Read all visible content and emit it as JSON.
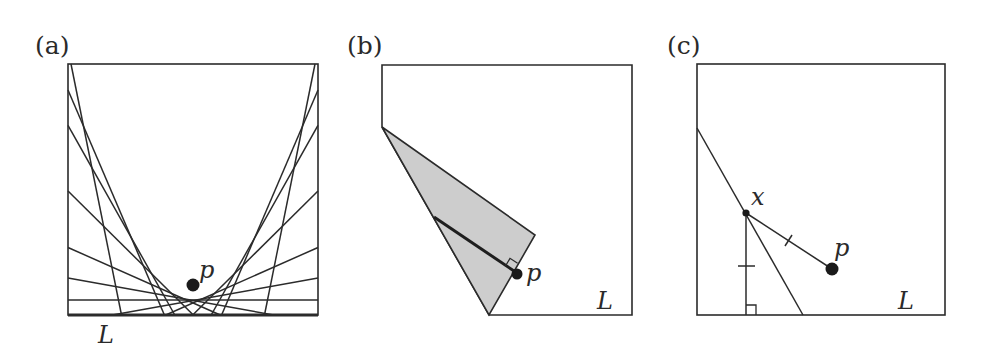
{
  "figure": {
    "panels": [
      {
        "id": "a",
        "label": "(a)",
        "point_label": "p",
        "line_label": "L",
        "description": "Family of fold creases tangent to a parabola with focus p and directrix L"
      },
      {
        "id": "b",
        "label": "(b)",
        "point_label": "p",
        "line_label": "L",
        "description": "Corner folded so that p lies on its edge; shaded flap with perpendicular from crease to p"
      },
      {
        "id": "c",
        "label": "(c)",
        "point_label": "p",
        "crease_point_label": "x",
        "line_label": "L",
        "description": "Crease point x equidistant from p and line L"
      }
    ],
    "colors": {
      "ink": "#2b2b2b",
      "shade": "#cdcdcd",
      "background": "#ffffff"
    }
  },
  "geometry": {
    "panel_a": {
      "box": [
        68,
        64,
        318,
        315
      ],
      "focus": [
        193,
        285
      ],
      "directrix_y": 315,
      "crease_offsets": [
        -149,
        -70,
        -53.3,
        -29.7,
        -13.3,
        -5.4,
        0,
        5.4,
        13.3,
        29.7,
        53.3,
        70,
        149
      ]
    },
    "panel_b": {
      "outline": [
        [
          382,
          65
        ],
        [
          632,
          65
        ],
        [
          632,
          315
        ],
        [
          489,
          315
        ],
        [
          382,
          127
        ]
      ],
      "flap": [
        [
          382,
          127
        ],
        [
          535,
          235
        ],
        [
          489,
          315
        ]
      ],
      "perpendicular": [
        [
          434,
          217
        ],
        [
          514,
          271
        ]
      ],
      "right_angle": [
        [
          505.5,
          266
        ],
        [
          510,
          258.3
        ],
        [
          517.6,
          263.3
        ]
      ],
      "p": [
        517,
        274
      ]
    },
    "panel_c": {
      "box": [
        697,
        64,
        945,
        315
      ],
      "crease": [
        [
          697,
          128
        ],
        [
          803,
          315
        ]
      ],
      "x": [
        746,
        213
      ],
      "p": [
        832,
        269
      ],
      "foot": [
        746,
        315
      ]
    }
  }
}
